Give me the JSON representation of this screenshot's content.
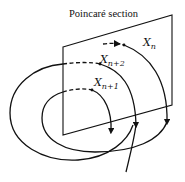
{
  "diagram": {
    "title": "Poincaré section",
    "labels": [
      {
        "id": "xn",
        "base": "X",
        "sub": "n"
      },
      {
        "id": "xn2",
        "base": "X",
        "sub": "n+2"
      },
      {
        "id": "xn1",
        "base": "X",
        "sub": "n+1"
      }
    ],
    "colors": {
      "stroke": "#111111",
      "background": "#ffffff"
    },
    "elements": [
      "poincare-plane",
      "trajectory-spiral",
      "crossing-points",
      "direction-arrows"
    ]
  }
}
